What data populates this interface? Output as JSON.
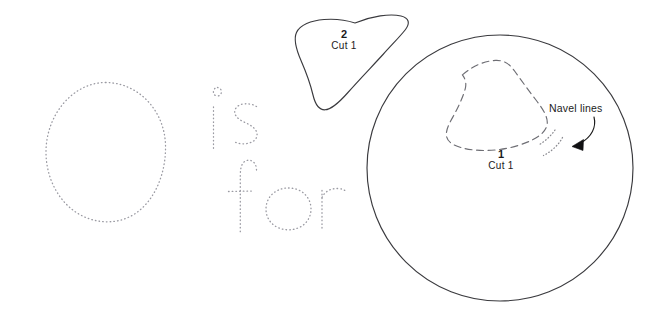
{
  "sheet": {
    "title": "O is for — appliqué pattern sheet",
    "background_color": "#ffffff",
    "ink_color": "#1b1b1b",
    "trace_color": "#8d8d96",
    "dash_color": "#6e6e74",
    "width": 669,
    "height": 322
  },
  "tracing": {
    "letter_capital": "O",
    "word_is": "is",
    "word_for": "for",
    "phrase": "O is for",
    "style": "dotted-trace"
  },
  "pieces": [
    {
      "id": "piece-1",
      "number": "1",
      "cut": "Cut 1",
      "shape": "circle",
      "outline": "solid"
    },
    {
      "id": "piece-2",
      "number": "2",
      "cut": "Cut 1",
      "shape": "leaf",
      "outline": "solid"
    }
  ],
  "annotations": {
    "navel_lines": "Navel lines",
    "placement_guide_style": "dashed",
    "navel_line_style": "dotted"
  }
}
